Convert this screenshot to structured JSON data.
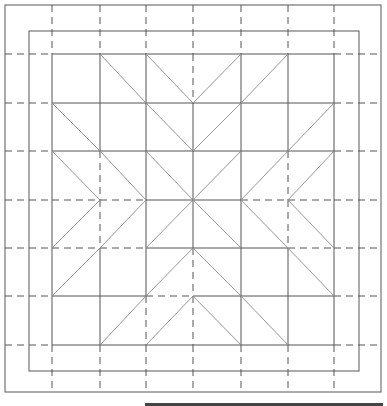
{
  "diagram": {
    "colors": {
      "line": "#555555",
      "diagonal": "#8a8a8a",
      "background": "#ffffff",
      "bottom_bar": "#444444"
    },
    "outer_border": {
      "x1": 5,
      "y1": 5,
      "x2": 381,
      "y2": 392
    },
    "inner_border": {
      "x1": 29,
      "y1": 31,
      "x2": 359,
      "y2": 371
    },
    "columns": [
      52,
      100,
      146,
      193,
      241,
      288,
      334
    ],
    "rows": [
      54,
      103,
      151,
      200,
      248,
      296,
      345
    ],
    "margin_dash_left": 5,
    "margin_dash_right": 381,
    "margin_dash_top": 5,
    "margin_dash_bottom": 392,
    "dashed_segments": [
      {
        "type": "v",
        "col": 3,
        "r0": 0,
        "r1": 1
      },
      {
        "type": "v",
        "col": 1,
        "r0": 2,
        "r1": 4
      },
      {
        "type": "v",
        "col": 5,
        "r0": 2,
        "r1": 4
      },
      {
        "type": "v",
        "col": 3,
        "r0": 4,
        "r1": 6
      },
      {
        "type": "v",
        "col": 2,
        "r0": 5,
        "r1": 6
      },
      {
        "type": "h",
        "row": 3,
        "c0": 0,
        "c1": 2
      },
      {
        "type": "h",
        "row": 3,
        "c0": 4,
        "c1": 6
      },
      {
        "type": "h",
        "row": 4,
        "c0": 0,
        "c1": 2
      },
      {
        "type": "h",
        "row": 4,
        "c0": 5,
        "c1": 6
      },
      {
        "type": "h",
        "row": 5,
        "c0": 2,
        "c1": 3
      }
    ],
    "diagonals": [
      [
        1,
        0,
        2,
        1
      ],
      [
        2,
        0,
        3,
        1
      ],
      [
        4,
        0,
        3,
        1
      ],
      [
        5,
        0,
        4,
        1
      ],
      [
        0,
        1,
        1,
        2
      ],
      [
        2,
        1,
        3,
        2
      ],
      [
        4,
        1,
        3,
        2
      ],
      [
        6,
        1,
        5,
        2
      ],
      [
        0,
        2,
        1,
        3
      ],
      [
        1,
        2,
        2,
        3
      ],
      [
        2,
        2,
        3,
        3
      ],
      [
        4,
        2,
        3,
        3
      ],
      [
        5,
        2,
        4,
        3
      ],
      [
        6,
        2,
        5,
        3
      ],
      [
        1,
        3,
        0,
        4
      ],
      [
        2,
        3,
        1,
        4
      ],
      [
        3,
        3,
        2,
        4
      ],
      [
        3,
        3,
        4,
        4
      ],
      [
        4,
        3,
        5,
        4
      ],
      [
        5,
        3,
        6,
        4
      ],
      [
        1,
        4,
        0,
        5
      ],
      [
        3,
        4,
        2,
        5
      ],
      [
        3,
        4,
        4,
        5
      ],
      [
        5,
        4,
        6,
        5
      ],
      [
        2,
        5,
        1,
        6
      ],
      [
        3,
        5,
        2,
        6
      ],
      [
        3,
        5,
        4,
        6
      ],
      [
        4,
        5,
        5,
        6
      ]
    ],
    "bottom_bar": {
      "x1": 145,
      "x2": 383,
      "y": 403,
      "height": 3
    }
  }
}
